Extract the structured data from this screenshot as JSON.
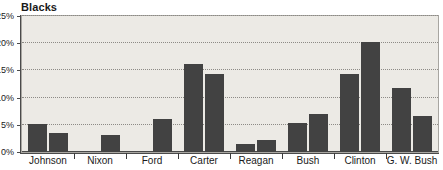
{
  "chart_data": {
    "type": "bar",
    "title": "Blacks",
    "xlabel": "",
    "ylabel": "",
    "ylim": [
      0,
      25
    ],
    "grid": true,
    "legend": false,
    "y_ticks": [
      "0%",
      "5%",
      "10%",
      "15%",
      "20%",
      "25%"
    ],
    "y_tick_values": [
      0,
      5,
      10,
      15,
      20,
      25
    ],
    "categories": [
      "Johnson",
      "Nixon",
      "Ford",
      "Carter",
      "Reagan",
      "Bush",
      "Clinton",
      "G. W. Bush"
    ],
    "series": [
      {
        "name": "first-term",
        "values": [
          5.1,
          null,
          null,
          16.2,
          1.4,
          5.3,
          14.3,
          11.8
        ]
      },
      {
        "name": "second-term",
        "values": [
          3.5,
          3.1,
          6.0,
          14.3,
          2.3,
          6.9,
          20.3,
          6.7
        ]
      }
    ],
    "colors": {
      "bar": "#424242",
      "plot_background": "#eceae5",
      "axis": "#4a4a4a",
      "gridline": "#8d8b86",
      "text": "#1a1a1a",
      "page_background": "#ffffff"
    }
  }
}
